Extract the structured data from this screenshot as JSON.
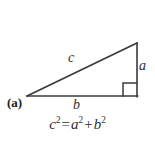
{
  "figure": {
    "panel_label": "(a)",
    "background_color": "#ffffff",
    "stroke_color": "#3a3a3a",
    "text_color": "#2f2f2f",
    "width": 155,
    "height": 142,
    "triangle": {
      "name": "right-triangle",
      "vertices": {
        "left": [
          27,
          96
        ],
        "bottom_right": [
          137,
          96
        ],
        "top_right": [
          137,
          43
        ]
      },
      "right_angle_marker": {
        "size": 14,
        "corner": "bottom-right"
      }
    },
    "side_labels": {
      "hypotenuse": "c",
      "base": "b",
      "vertical": "a"
    },
    "equation": {
      "lhs_var": "c",
      "lhs_exp": "2",
      "equals": "=",
      "rhs_first_var": "a",
      "rhs_first_exp": "2",
      "plus": "+",
      "rhs_second_var": "b",
      "rhs_second_exp": "2",
      "plain_text": "c2 = a2 + b2"
    }
  }
}
